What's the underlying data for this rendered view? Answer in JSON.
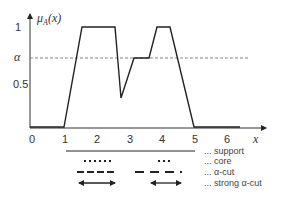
{
  "figure": {
    "y_axis_label": "μA(x)",
    "y_axis_label_main": "μ",
    "y_axis_label_sub": "A",
    "y_axis_label_arg": "(x)",
    "x_axis_label": "x",
    "x_ticks": [
      "0",
      "1",
      "2",
      "3",
      "4",
      "5",
      "6"
    ],
    "y_ticks": [
      {
        "label": "1",
        "value": 1.0
      },
      {
        "label": "α",
        "value": 0.7
      },
      {
        "label": "0.5",
        "value": 0.5
      }
    ],
    "alpha_level": 0.7,
    "membership_function": [
      {
        "x": 0,
        "y": 0
      },
      {
        "x": 1,
        "y": 0
      },
      {
        "x": 1.55,
        "y": 1
      },
      {
        "x": 2.55,
        "y": 1
      },
      {
        "x": 2.75,
        "y": 0.29
      },
      {
        "x": 3.15,
        "y": 0.69
      },
      {
        "x": 3.6,
        "y": 0.69
      },
      {
        "x": 3.85,
        "y": 1
      },
      {
        "x": 4.25,
        "y": 1
      },
      {
        "x": 4.97,
        "y": 0
      },
      {
        "x": 6.4,
        "y": 0
      }
    ],
    "legend": [
      {
        "style": "solid",
        "label": "... support"
      },
      {
        "style": "dotted",
        "label": "... core"
      },
      {
        "style": "dashed",
        "label": "... α-cut"
      },
      {
        "style": "double-arrow",
        "label": "... strong α-cut"
      }
    ],
    "colors": {
      "line": "#222222",
      "axis": "#333333",
      "dashed_alpha": "#555555"
    }
  }
}
